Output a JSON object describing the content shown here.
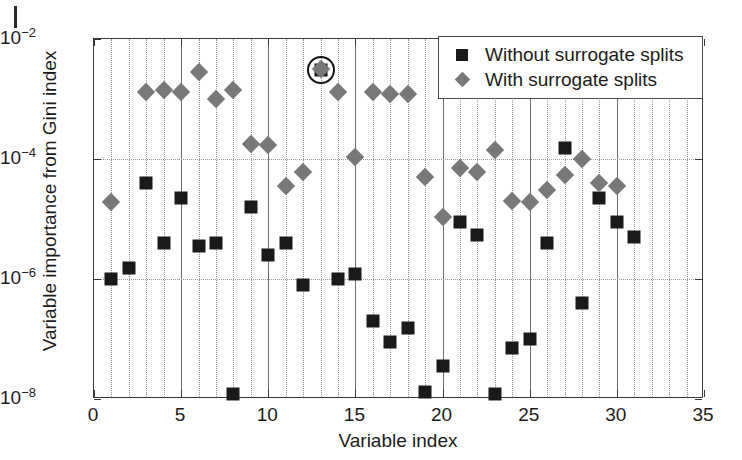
{
  "chart_data": {
    "type": "scatter",
    "title": "",
    "xlabel": "Variable index",
    "ylabel": "Variable importance from Gini index",
    "xlim": [
      0,
      35
    ],
    "ylim": [
      1e-08,
      0.01
    ],
    "yscale": "log",
    "xticks": [
      0,
      5,
      10,
      15,
      20,
      25,
      30,
      35
    ],
    "xticklabels": [
      "0",
      "5",
      "10",
      "15",
      "20",
      "25",
      "30",
      "35"
    ],
    "yticks": [
      0.01,
      0.0001,
      1e-06,
      1e-08
    ],
    "yticklabels": [
      "10-2",
      "10-4",
      "10-6",
      "10-8"
    ],
    "grid": true,
    "legend_position": "upper right",
    "x": [
      1,
      2,
      3,
      4,
      5,
      6,
      7,
      8,
      9,
      10,
      11,
      12,
      13,
      14,
      15,
      16,
      17,
      18,
      19,
      20,
      21,
      22,
      23,
      24,
      25,
      26,
      27,
      28,
      29,
      30,
      31
    ],
    "series": [
      {
        "name": "Without surrogate splits",
        "marker": "square",
        "color": "#1a1a1a",
        "values": [
          1e-06,
          1.5e-06,
          4e-05,
          4e-06,
          2.2e-05,
          3.5e-06,
          4e-06,
          1.2e-08,
          1.6e-05,
          2.5e-06,
          4e-06,
          8e-07,
          0.003,
          1e-06,
          1.2e-06,
          2e-07,
          9e-08,
          1.5e-07,
          1.3e-08,
          3.5e-08,
          9e-06,
          5.5e-06,
          1.2e-08,
          7e-08,
          1e-07,
          4e-06,
          0.00015,
          4e-07,
          2.2e-05,
          9e-06,
          5e-06
        ]
      },
      {
        "name": "With surrogate splits",
        "marker": "diamond",
        "color": "#787878",
        "values": [
          1.9e-05,
          null,
          0.0013,
          0.0014,
          0.0013,
          0.0028,
          0.001,
          0.0014,
          0.00018,
          0.00017,
          3.5e-05,
          6e-05,
          0.0032,
          0.0013,
          0.00011,
          0.0013,
          0.0012,
          0.0012,
          5e-05,
          1.1e-05,
          7e-05,
          6e-05,
          0.00014,
          2e-05,
          1.9e-05,
          3e-05,
          5.5e-05,
          0.0001,
          4e-05,
          3.5e-05,
          null
        ]
      }
    ],
    "annotations": [
      {
        "type": "circle-highlight",
        "x": 13,
        "y": 0.003,
        "label": "circled-point"
      }
    ]
  },
  "legend": {
    "entries": [
      {
        "label": "Without surrogate splits",
        "marker": "square"
      },
      {
        "label": "With surrogate splits",
        "marker": "diamond"
      }
    ]
  }
}
